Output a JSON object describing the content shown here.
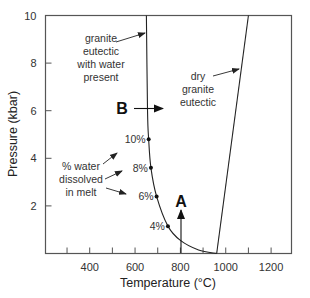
{
  "figure": {
    "xlabel": "Temperature (°C)",
    "ylabel": "Pressure (kbar)",
    "x_ticks": [
      {
        "value": 300,
        "label": ""
      },
      {
        "value": 400,
        "label": "400"
      },
      {
        "value": 500,
        "label": ""
      },
      {
        "value": 600,
        "label": "600"
      },
      {
        "value": 700,
        "label": ""
      },
      {
        "value": 800,
        "label": "800"
      },
      {
        "value": 900,
        "label": ""
      },
      {
        "value": 1000,
        "label": "1000"
      },
      {
        "value": 1100,
        "label": ""
      },
      {
        "value": 1200,
        "label": "1200"
      }
    ],
    "y_ticks": [
      {
        "value": 2,
        "label": "2"
      },
      {
        "value": 4,
        "label": "4"
      },
      {
        "value": 6,
        "label": "6"
      },
      {
        "value": 8,
        "label": "8"
      },
      {
        "value": 10,
        "label": "10"
      }
    ],
    "xlim": [
      205,
      1290
    ],
    "ylim": [
      0,
      10
    ],
    "annotations": {
      "wet_eutectic": [
        "granite",
        "eutectic",
        "with water",
        "present"
      ],
      "dry_eutectic": [
        "dry",
        "granite",
        "eutectic"
      ],
      "water_dissolved": [
        "% water",
        "dissolved",
        "in melt"
      ],
      "point_a": "A",
      "point_b": "B"
    },
    "water_labels": [
      {
        "label": "10%",
        "T": 660,
        "P": 4.8
      },
      {
        "label": "8%",
        "T": 670,
        "P": 3.6
      },
      {
        "label": "6%",
        "T": 695,
        "P": 2.4
      },
      {
        "label": "4%",
        "T": 745,
        "P": 1.15
      }
    ]
  },
  "chart_data": {
    "type": "line",
    "title": "",
    "xlabel": "Temperature (°C)",
    "ylabel": "Pressure (kbar)",
    "xlim": [
      205,
      1290
    ],
    "ylim": [
      0,
      10
    ],
    "grid": false,
    "series": [
      {
        "name": "granite eutectic with water present",
        "x": [
          650,
          655,
          660,
          670,
          695,
          745,
          800,
          880,
          960
        ],
        "y": [
          10,
          6.0,
          4.8,
          3.6,
          2.4,
          1.15,
          0.55,
          0.15,
          0.0
        ]
      },
      {
        "name": "dry granite eutectic",
        "x": [
          960,
          1100
        ],
        "y": [
          0,
          10
        ]
      }
    ],
    "markers": [
      {
        "label": "10%",
        "x": 660,
        "y": 4.8
      },
      {
        "label": "8%",
        "x": 670,
        "y": 3.6
      },
      {
        "label": "6%",
        "x": 695,
        "y": 2.4
      },
      {
        "label": "4%",
        "x": 745,
        "y": 1.15
      }
    ],
    "arrows": [
      {
        "label": "A",
        "direction": "up",
        "x": 800,
        "y_from": 0,
        "y_to": 1.8
      },
      {
        "label": "B",
        "direction": "right",
        "y": 6.1,
        "x_from": 610,
        "x_to": 725
      }
    ],
    "annotations": [
      "granite eutectic with water present",
      "dry granite eutectic",
      "% water dissolved in melt"
    ]
  }
}
